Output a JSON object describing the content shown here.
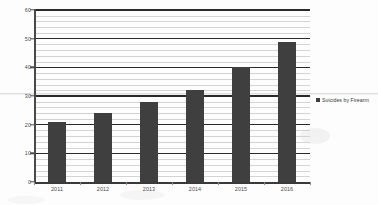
{
  "chart_data": {
    "type": "bar",
    "title": "",
    "xlabel": "",
    "ylabel": "",
    "categories": [
      "2011",
      "2012",
      "2013",
      "2014",
      "2015",
      "2016"
    ],
    "series": [
      {
        "name": "Suicides by Firearm",
        "color": "#3f3f3f",
        "values": [
          21,
          24,
          28,
          32,
          40,
          49
        ]
      }
    ],
    "ylim": [
      0,
      60
    ],
    "y_major_ticks": [
      0,
      10,
      20,
      30,
      40,
      50,
      60
    ],
    "y_minor_interval": 2,
    "grid": "horizontal",
    "legend_position": "right"
  },
  "legend": {
    "entries": [
      {
        "label": "Suicides by Firearm",
        "color": "#3f3f3f"
      }
    ]
  },
  "axis": {
    "y_tick_labels": [
      "0",
      "10",
      "20",
      "30",
      "40",
      "50",
      "60"
    ],
    "x_tick_labels": [
      "2011",
      "2012",
      "2013",
      "2014",
      "2015",
      "2016"
    ]
  }
}
